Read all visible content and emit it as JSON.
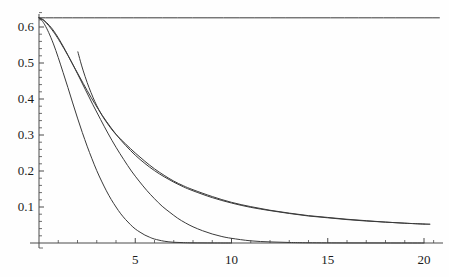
{
  "chart_data": {
    "type": "line",
    "title": "",
    "subtitle": "",
    "xlabel": "",
    "ylabel": "",
    "xlim": [
      0,
      20.8
    ],
    "ylim": [
      0,
      0.655
    ],
    "grid": false,
    "legend": null,
    "background_color": "#fefefe",
    "line_color": "#3a3a3a",
    "axis_color": "#4a4a4a",
    "x_ticks_major": [
      5,
      10,
      15,
      20
    ],
    "x_tick_labels": [
      "5",
      "10",
      "15",
      "20"
    ],
    "x_ticks_minor": [
      1,
      2,
      3,
      4,
      6,
      7,
      8,
      9,
      11,
      12,
      13,
      14,
      16,
      17,
      18,
      19,
      20.5
    ],
    "y_ticks_major": [
      0.1,
      0.2,
      0.3,
      0.4,
      0.5,
      0.6
    ],
    "y_tick_labels": [
      "0.1",
      "0.2",
      "0.3",
      "0.4",
      "0.5",
      "0.6"
    ],
    "y_ticks_minor": [
      0.02,
      0.04,
      0.06,
      0.08,
      0.12,
      0.14,
      0.16,
      0.18,
      0.22,
      0.24,
      0.26,
      0.28,
      0.32,
      0.34,
      0.36,
      0.38,
      0.42,
      0.44,
      0.46,
      0.48,
      0.52,
      0.54,
      0.56,
      0.58,
      0.62,
      0.64
    ],
    "series": [
      {
        "name": "constant-asymptote",
        "style": "solid",
        "points": [
          [
            0,
            0.6255
          ],
          [
            20.8,
            0.6255
          ]
        ]
      },
      {
        "name": "fast-decay-curve",
        "style": "solid",
        "points": [
          [
            0.0,
            0.6255
          ],
          [
            0.15,
            0.618
          ],
          [
            0.3,
            0.606
          ],
          [
            0.5,
            0.585
          ],
          [
            0.75,
            0.553
          ],
          [
            1.0,
            0.515
          ],
          [
            1.25,
            0.474
          ],
          [
            1.5,
            0.432
          ],
          [
            1.75,
            0.389
          ],
          [
            2.0,
            0.347
          ],
          [
            2.25,
            0.307
          ],
          [
            2.5,
            0.269
          ],
          [
            2.75,
            0.234
          ],
          [
            3.0,
            0.201
          ],
          [
            3.25,
            0.172
          ],
          [
            3.5,
            0.145
          ],
          [
            3.75,
            0.121
          ],
          [
            4.0,
            0.1
          ],
          [
            4.25,
            0.081
          ],
          [
            4.5,
            0.065
          ],
          [
            4.75,
            0.051
          ],
          [
            5.0,
            0.039
          ],
          [
            5.25,
            0.03
          ],
          [
            5.5,
            0.022
          ],
          [
            5.75,
            0.016
          ],
          [
            6.0,
            0.011
          ],
          [
            6.5,
            0.005
          ],
          [
            7.0,
            0.002
          ],
          [
            7.5,
            0.001
          ],
          [
            8.0,
            0.0004
          ],
          [
            9.0,
            0.0001
          ],
          [
            10.0,
            0.0
          ]
        ]
      },
      {
        "name": "medium-decay-curve",
        "style": "solid",
        "points": [
          [
            0.0,
            0.6255
          ],
          [
            0.2,
            0.621
          ],
          [
            0.4,
            0.612
          ],
          [
            0.7,
            0.594
          ],
          [
            1.0,
            0.57
          ],
          [
            1.3,
            0.542
          ],
          [
            1.6,
            0.512
          ],
          [
            2.0,
            0.47
          ],
          [
            2.4,
            0.427
          ],
          [
            2.8,
            0.384
          ],
          [
            3.2,
            0.343
          ],
          [
            3.6,
            0.303
          ],
          [
            4.0,
            0.266
          ],
          [
            4.4,
            0.232
          ],
          [
            4.8,
            0.2
          ],
          [
            5.2,
            0.172
          ],
          [
            5.6,
            0.146
          ],
          [
            6.0,
            0.123
          ],
          [
            6.4,
            0.102
          ],
          [
            6.8,
            0.085
          ],
          [
            7.2,
            0.069
          ],
          [
            7.6,
            0.056
          ],
          [
            8.0,
            0.045
          ],
          [
            8.5,
            0.034
          ],
          [
            9.0,
            0.025
          ],
          [
            9.5,
            0.018
          ],
          [
            10.0,
            0.013
          ],
          [
            11.0,
            0.006
          ],
          [
            12.0,
            0.003
          ],
          [
            13.0,
            0.0015
          ],
          [
            14.0,
            0.0007
          ],
          [
            16.0,
            0.0002
          ],
          [
            18.0,
            0.0001
          ],
          [
            20.0,
            0.0
          ]
        ]
      },
      {
        "name": "slow-decay-curve",
        "style": "solid",
        "points": [
          [
            0.0,
            0.6255
          ],
          [
            0.25,
            0.618
          ],
          [
            0.5,
            0.604
          ],
          [
            0.8,
            0.583
          ],
          [
            1.1,
            0.558
          ],
          [
            1.5,
            0.521
          ],
          [
            1.9,
            0.482
          ],
          [
            2.3,
            0.443
          ],
          [
            2.7,
            0.405
          ],
          [
            3.1,
            0.37
          ],
          [
            3.5,
            0.338
          ],
          [
            4.0,
            0.302
          ],
          [
            4.5,
            0.271
          ],
          [
            5.0,
            0.244
          ],
          [
            5.5,
            0.221
          ],
          [
            6.0,
            0.201
          ],
          [
            6.5,
            0.184
          ],
          [
            7.0,
            0.169
          ],
          [
            7.5,
            0.156
          ],
          [
            8.0,
            0.145
          ],
          [
            9.0,
            0.126
          ],
          [
            10.0,
            0.111
          ],
          [
            11.0,
            0.099
          ],
          [
            12.0,
            0.09
          ],
          [
            13.0,
            0.082
          ],
          [
            14.0,
            0.075
          ],
          [
            15.0,
            0.07
          ],
          [
            16.0,
            0.065
          ],
          [
            17.0,
            0.061
          ],
          [
            18.0,
            0.058
          ],
          [
            19.0,
            0.055
          ],
          [
            20.0,
            0.0525
          ],
          [
            20.3,
            0.052
          ]
        ]
      },
      {
        "name": "truncated-branch-curve",
        "style": "solid",
        "points": [
          [
            2.02,
            0.531
          ],
          [
            2.15,
            0.505
          ],
          [
            2.3,
            0.478
          ],
          [
            2.5,
            0.446
          ],
          [
            2.7,
            0.418
          ],
          [
            2.9,
            0.393
          ],
          [
            3.1,
            0.371
          ],
          [
            3.3,
            0.352
          ],
          [
            3.5,
            0.336
          ],
          [
            3.8,
            0.314
          ],
          [
            4.1,
            0.296
          ],
          [
            4.5,
            0.275
          ],
          [
            5.0,
            0.25
          ],
          [
            5.5,
            0.227
          ],
          [
            6.0,
            0.206
          ],
          [
            6.5,
            0.188
          ],
          [
            7.0,
            0.172
          ],
          [
            7.5,
            0.159
          ],
          [
            8.0,
            0.148
          ],
          [
            9.0,
            0.129
          ],
          [
            10.0,
            0.113
          ],
          [
            11.0,
            0.101
          ],
          [
            12.0,
            0.091
          ],
          [
            13.0,
            0.083
          ],
          [
            14.0,
            0.076
          ],
          [
            15.0,
            0.071
          ],
          [
            16.0,
            0.066
          ],
          [
            17.0,
            0.062
          ],
          [
            18.0,
            0.058
          ],
          [
            19.0,
            0.055
          ],
          [
            20.0,
            0.0527
          ],
          [
            20.3,
            0.0522
          ]
        ]
      }
    ]
  },
  "axes": {
    "origin_px": {
      "x": 39,
      "y": 243
    },
    "x_end_px": 443,
    "y_top_px": 14
  }
}
